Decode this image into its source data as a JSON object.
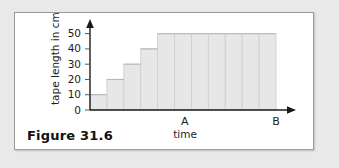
{
  "figure": {
    "caption": "Figure 31.6"
  },
  "chart_data": {
    "type": "bar",
    "title": "",
    "xlabel": "time",
    "ylabel": "tape length in cm",
    "ylim": [
      0,
      55
    ],
    "yticks": [
      0,
      10,
      20,
      30,
      40,
      50
    ],
    "ytick_labels": [
      "0",
      "10",
      "20",
      "30",
      "40",
      "50"
    ],
    "grid": false,
    "legend": null,
    "categories": [
      "1",
      "2",
      "3",
      "4",
      "5",
      "6",
      "7",
      "8",
      "9",
      "10",
      "11"
    ],
    "values": [
      10,
      20,
      30,
      40,
      50,
      50,
      50,
      50,
      50,
      50,
      50
    ],
    "annotations": [
      {
        "label": "A",
        "axis": "x",
        "value": 5.6
      },
      {
        "label": "B",
        "axis": "x",
        "value": 11.0
      }
    ]
  }
}
